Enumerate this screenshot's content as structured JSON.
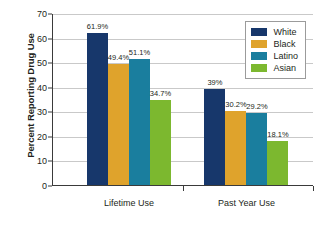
{
  "chart_data": {
    "type": "bar",
    "title": "",
    "xlabel": "",
    "ylabel": "Percent Reporting Drug Use",
    "ylim": [
      0,
      70
    ],
    "ytick_step": 10,
    "yticks": [
      0,
      10,
      20,
      30,
      40,
      50,
      60,
      70
    ],
    "grid": true,
    "legend_position": "top-right",
    "categories": [
      "Lifetime Use",
      "Past Year Use"
    ],
    "series": [
      {
        "name": "White",
        "color": "#17376b",
        "values": [
          61.9,
          39.0
        ],
        "labels": [
          "61.9%",
          "39%"
        ]
      },
      {
        "name": "Black",
        "color": "#dfa32c",
        "values": [
          49.4,
          30.2
        ],
        "labels": [
          "49.4%",
          "30.2%"
        ]
      },
      {
        "name": "Latino",
        "color": "#1a7e9e",
        "values": [
          51.1,
          29.2
        ],
        "labels": [
          "51.1%",
          "29.2%"
        ]
      },
      {
        "name": "Asian",
        "color": "#7cb82f",
        "values": [
          34.7,
          18.1
        ],
        "labels": [
          "34.7%",
          "18.1%"
        ]
      }
    ]
  },
  "axis": {
    "y_title": "Percent Reporting Drug Use",
    "y_tick_labels": [
      "70",
      "60",
      "50",
      "40",
      "30",
      "20",
      "10",
      "0"
    ],
    "x_tick_labels": [
      "Lifetime Use",
      "Past Year Use"
    ]
  },
  "legend": {
    "entries": [
      {
        "label": "White"
      },
      {
        "label": "Black"
      },
      {
        "label": "Latino"
      },
      {
        "label": "Asian"
      }
    ]
  }
}
